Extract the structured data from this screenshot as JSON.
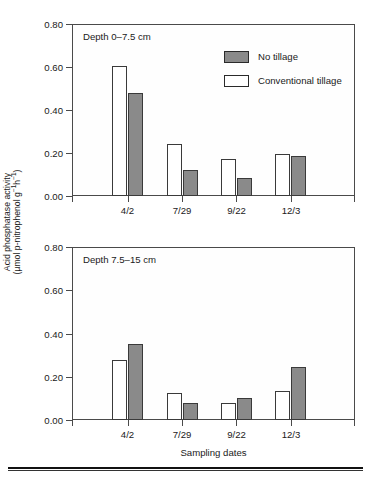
{
  "figure": {
    "background_color": "#ffffff",
    "no_tillage_color": "#8a8a8a",
    "conventional_tillage_color": "#ffffff",
    "axis_color": "#4a4a4a",
    "ylabel_line1": "Acid phosphatase activity",
    "ylabel_line2_pre": "(µmol p-nitrophenol g",
    "ylabel_line2_sup1": "−1",
    "ylabel_line2_mid": "h",
    "ylabel_line2_sup2": "−1",
    "ylabel_line2_post": ")",
    "xaxis_title": "Sampling dates"
  },
  "legend": {
    "items": [
      {
        "label": "No tillage",
        "swatch": "gray-filled-swatch"
      },
      {
        "label": "Conventional tillage",
        "swatch": "white-open-swatch"
      }
    ]
  },
  "panels": [
    {
      "id": "top",
      "caption": "Depth 0–7.5 cm"
    },
    {
      "id": "bottom",
      "caption": "Depth 7.5–15 cm"
    }
  ],
  "chart_data": [
    {
      "type": "bar",
      "title": "Depth 0–7.5 cm",
      "xlabel": "Sampling dates",
      "ylabel": "Acid phosphatase activity (µmol p-nitrophenol g−1h−1)",
      "categories": [
        "4/2",
        "7/29",
        "9/22",
        "12/3"
      ],
      "ylim": [
        0.0,
        0.8
      ],
      "yticks": [
        "0.00",
        "0.20",
        "0.40",
        "0.60",
        "0.80"
      ],
      "ytick_values": [
        0.0,
        0.2,
        0.4,
        0.6,
        0.8
      ],
      "grid": false,
      "legend_position": "top-right inside",
      "series": [
        {
          "name": "Conventional tillage",
          "fill": "white",
          "values": [
            0.605,
            0.24,
            0.17,
            0.195
          ]
        },
        {
          "name": "No tillage",
          "fill": "gray",
          "values": [
            0.48,
            0.12,
            0.085,
            0.185
          ]
        }
      ]
    },
    {
      "type": "bar",
      "title": "Depth 7.5–15 cm",
      "xlabel": "Sampling dates",
      "ylabel": "Acid phosphatase activity (µmol p-nitrophenol g−1h−1)",
      "categories": [
        "4/2",
        "7/29",
        "9/22",
        "12/3"
      ],
      "ylim": [
        0.0,
        0.8
      ],
      "yticks": [
        "0.00",
        "0.20",
        "0.40",
        "0.60",
        "0.80"
      ],
      "ytick_values": [
        0.0,
        0.2,
        0.4,
        0.6,
        0.8
      ],
      "grid": false,
      "legend_position": "none",
      "series": [
        {
          "name": "Conventional tillage",
          "fill": "white",
          "values": [
            0.277,
            0.125,
            0.08,
            0.132
          ]
        },
        {
          "name": "No tillage",
          "fill": "gray",
          "values": [
            0.352,
            0.08,
            0.1,
            0.245
          ]
        }
      ]
    }
  ]
}
